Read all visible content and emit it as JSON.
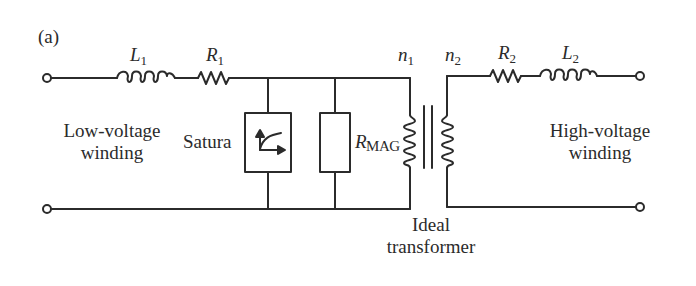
{
  "figure": {
    "panel_label": "(a)",
    "components": {
      "L1": {
        "symbol": "L",
        "subscript": "1",
        "type": "inductor"
      },
      "R1": {
        "symbol": "R",
        "subscript": "1",
        "type": "resistor"
      },
      "n1": {
        "symbol": "n",
        "subscript": "1",
        "type": "winding-turns"
      },
      "n2": {
        "symbol": "n",
        "subscript": "2",
        "type": "winding-turns"
      },
      "R2": {
        "symbol": "R",
        "subscript": "2",
        "type": "resistor"
      },
      "L2": {
        "symbol": "L",
        "subscript": "2",
        "type": "inductor"
      },
      "saturation": {
        "label": "Satura",
        "type": "nonlinear-saturation-element"
      },
      "rmag": {
        "symbol": "R",
        "subscript": "MAG",
        "type": "resistor-box"
      }
    },
    "labels": {
      "low_voltage_line1": "Low-voltage",
      "low_voltage_line2": "winding",
      "high_voltage_line1": "High-voltage",
      "high_voltage_line2": "winding",
      "ideal_line1": "Ideal",
      "ideal_line2": "transformer"
    },
    "colors": {
      "stroke": "#2b2b2b",
      "background": "#ffffff"
    }
  }
}
